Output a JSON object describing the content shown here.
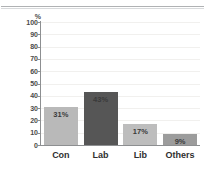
{
  "chart_data": {
    "type": "bar",
    "title": "",
    "subtitle": "",
    "xlabel": "",
    "ylabel": "%",
    "categories": [
      "Con",
      "Lab",
      "Lib",
      "Others"
    ],
    "values": [
      31,
      43,
      17,
      9
    ],
    "data_labels": [
      "31%",
      "43%",
      "17%",
      "9%"
    ],
    "bar_colors": [
      "#b9b9b9",
      "#565656",
      "#bdbdbd",
      "#9c9c9c"
    ],
    "ylim": [
      0,
      100
    ],
    "ytick_step": 10,
    "ytick_labels": [
      "100",
      "90",
      "80",
      "70",
      "60",
      "50",
      "40",
      "30",
      "20",
      "10",
      "0"
    ],
    "ytick_values": [
      100,
      90,
      80,
      70,
      60,
      50,
      40,
      30,
      20,
      10,
      0
    ],
    "grid": true,
    "grid_orientation": "horizontal",
    "legend": false,
    "legend_position": "none",
    "axis_color": "#8d8f91",
    "gridline_color": "#f1f0ee",
    "label_text_color": "#3a3a3a",
    "background": "#ffffff"
  },
  "decor": {
    "top_rule_color": "#b0b2b4"
  }
}
